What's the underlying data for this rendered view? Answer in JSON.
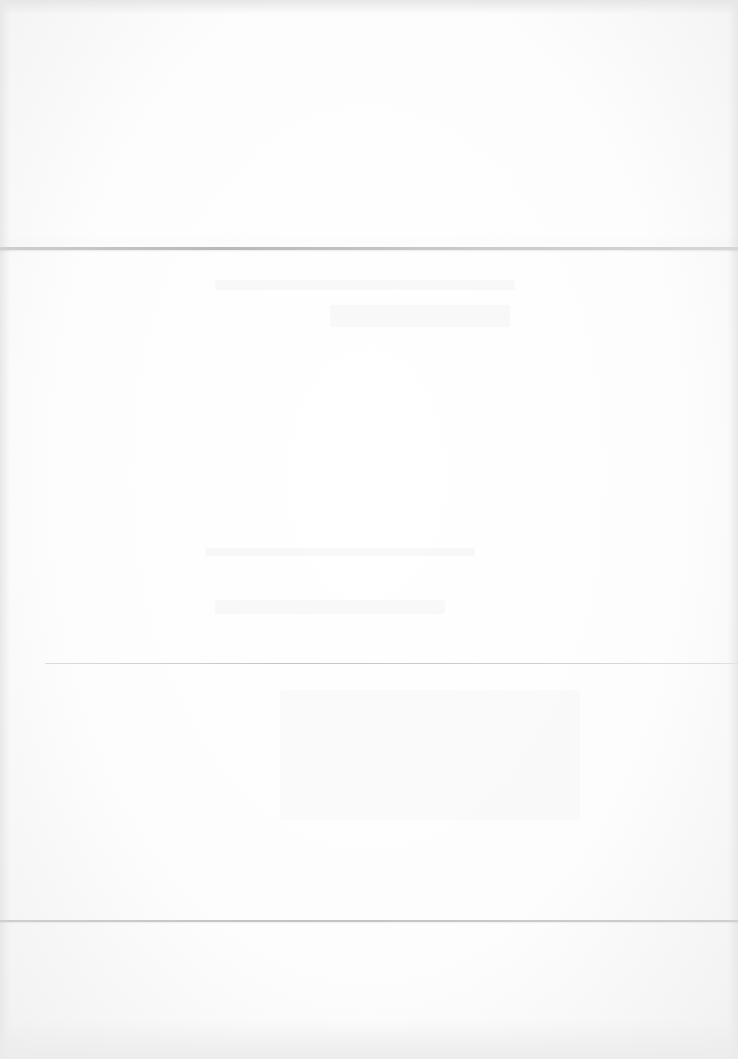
{
  "document": {
    "type": "blank-sheet",
    "visible_text": [],
    "folds": [
      {
        "y": 247
      },
      {
        "y": 663
      },
      {
        "y": 920
      }
    ],
    "colors": {
      "paper": "#ffffff",
      "fold_shadow": "#c4c4c4"
    }
  }
}
